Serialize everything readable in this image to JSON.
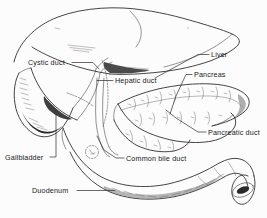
{
  "figure": {
    "kind": "anatomical-line-drawing",
    "style": "pen-and-ink hatched medical illustration",
    "background_color": "#fcfcfc",
    "ink_color": "#232323",
    "label_color": "#1a1a1a",
    "width": 267,
    "height": 218
  },
  "labels": [
    {
      "id": "cystic-duct",
      "text": "Cystic duct",
      "x": 28,
      "y": 65,
      "anchor": "start",
      "leader": "M 72 62.5 L 93 62.5 L 99 69"
    },
    {
      "id": "liver",
      "text": "Liver",
      "x": 211,
      "y": 57,
      "anchor": "start",
      "leader": "M 209 54.5 L 198 54.5 L 155 78"
    },
    {
      "id": "hepatic-duct",
      "text": "Hepatic duct",
      "x": 115,
      "y": 83,
      "anchor": "start",
      "leader": "M 113 80.5 L 97 80.5"
    },
    {
      "id": "pancreas",
      "text": "Pancreas",
      "x": 194,
      "y": 77,
      "anchor": "start",
      "leader": "M 192 74.5 L 186 74.5 L 176 96 L 170 114"
    },
    {
      "id": "pancreatic-duct",
      "text": "Pancreatic duct",
      "x": 208,
      "y": 135,
      "anchor": "start",
      "leader": "M 206 132 L 198 132 L 176 118 L 166 110"
    },
    {
      "id": "gallbladder",
      "text": "Gallbladder",
      "x": 5,
      "y": 160,
      "anchor": "start",
      "leader": "M 50 157 L 56 157 L 56 113"
    },
    {
      "id": "common-bile-duct",
      "text": "Common bile duct",
      "x": 126,
      "y": 161,
      "anchor": "start",
      "leader": "M 124 158 L 116 158 L 104 150 L 97 136"
    },
    {
      "id": "duodenum",
      "text": "Duodenum",
      "x": 32,
      "y": 193,
      "anchor": "start",
      "leader": "M 77 190.5 L 115 190.5"
    }
  ],
  "structures": [
    {
      "id": "liver-body",
      "name": "Liver"
    },
    {
      "id": "gallbladder-body",
      "name": "Gallbladder"
    },
    {
      "id": "pancreas-body",
      "name": "Pancreas"
    },
    {
      "id": "duodenum-body",
      "name": "Duodenum"
    },
    {
      "id": "cystic-duct-tube",
      "name": "Cystic duct"
    },
    {
      "id": "hepatic-duct-tube",
      "name": "Hepatic duct"
    },
    {
      "id": "common-bile-duct-tube",
      "name": "Common bile duct"
    },
    {
      "id": "pancreatic-duct-tube",
      "name": "Pancreatic duct"
    }
  ]
}
